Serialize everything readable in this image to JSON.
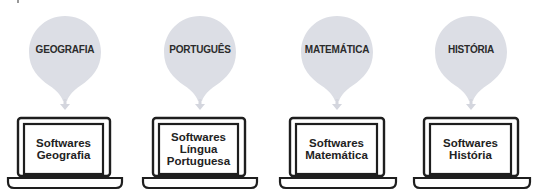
{
  "colors": {
    "balloon_fill": "#dcdee5",
    "label_text": "#2b2b2b",
    "laptop_stroke": "#1e1e1e"
  },
  "subjects": [
    {
      "balloon_label": "GEOGRAFIA",
      "screen_lines": [
        "Softwares",
        "Geografia"
      ]
    },
    {
      "balloon_label": "PORTUGUÊS",
      "screen_lines": [
        "Softwares",
        "Língua",
        "Portuguesa"
      ]
    },
    {
      "balloon_label": "MATEMÁTICA",
      "screen_lines": [
        "Softwares",
        "Matemática"
      ]
    },
    {
      "balloon_label": "HISTÓRIA",
      "screen_lines": [
        "Softwares",
        "História"
      ]
    }
  ]
}
